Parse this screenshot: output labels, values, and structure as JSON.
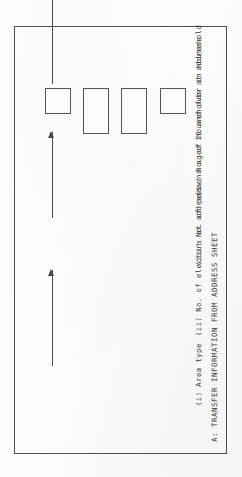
{
  "document": {
    "section_label": "A:",
    "title": "A: TRANSFER INFORMATION FROM ADDRESS SHEET",
    "orientation": "rotated-90-ccw",
    "page_background": "#fdfdfc",
    "ink_color": "#3a3a3a",
    "rule_color": "#4e4e4e"
  },
  "items": [
    {
      "number": "(i)",
      "label": "(i)    Area type",
      "caption": "Area type",
      "box_cells": 1,
      "value": ""
    },
    {
      "number": "(ii)",
      "label": "(ii)   No. of electors at address",
      "caption": "No. of electors at address",
      "box_cells": 2,
      "value": ""
    },
    {
      "number": "(iii)",
      "label": "(iii)  No. of persons aged 16 and over in household",
      "caption": "No. of persons aged 16 and over in household",
      "box_cells": 2,
      "value": ""
    },
    {
      "number": "(iv)",
      "label": "(iv)   No. of households at address",
      "caption": "No. of households at address",
      "box_cells": 1,
      "value": ""
    }
  ]
}
